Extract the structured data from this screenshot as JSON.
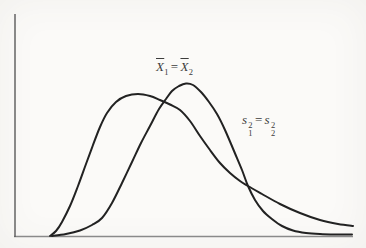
{
  "figure": {
    "background": "#fbfaf8",
    "axes": {
      "stroke_width": 1.4,
      "y_axis": {
        "x1": 15,
        "y1": 14,
        "x2": 15,
        "y2": 237,
        "color": "#5a5a5a"
      },
      "x_axis": {
        "x1": 14,
        "y1": 236.5,
        "x2": 353,
        "y2": 236.5,
        "color": "#8a8a8a"
      }
    },
    "curves": [
      {
        "name": "right-skewed-curve",
        "color": "#222222",
        "stroke_width": 2,
        "points": [
          [
            50,
            236
          ],
          [
            56,
            231
          ],
          [
            62,
            222
          ],
          [
            70,
            206
          ],
          [
            78,
            186
          ],
          [
            86,
            164
          ],
          [
            93,
            145
          ],
          [
            100,
            127
          ],
          [
            107,
            113
          ],
          [
            116,
            102
          ],
          [
            126,
            96
          ],
          [
            138,
            94
          ],
          [
            150,
            96
          ],
          [
            160,
            100
          ],
          [
            170,
            104.5
          ],
          [
            180,
            110
          ],
          [
            190,
            121
          ],
          [
            200,
            136
          ],
          [
            210,
            150
          ],
          [
            220,
            163
          ],
          [
            230,
            173
          ],
          [
            240,
            181
          ],
          [
            248,
            186
          ],
          [
            262,
            194
          ],
          [
            280,
            204
          ],
          [
            300,
            213
          ],
          [
            320,
            220
          ],
          [
            338,
            224
          ],
          [
            353,
            226
          ]
        ]
      },
      {
        "name": "left-skewed-curve",
        "color": "#222222",
        "stroke_width": 2,
        "points": [
          [
            52,
            236
          ],
          [
            66,
            234
          ],
          [
            80,
            230.5
          ],
          [
            92,
            225
          ],
          [
            102,
            218
          ],
          [
            112,
            203
          ],
          [
            122,
            183
          ],
          [
            132,
            162
          ],
          [
            141,
            143
          ],
          [
            150,
            126
          ],
          [
            159,
            109
          ],
          [
            166,
            99
          ],
          [
            172,
            91
          ],
          [
            179,
            86
          ],
          [
            186,
            83.5
          ],
          [
            193,
            85
          ],
          [
            201,
            92
          ],
          [
            209,
            102
          ],
          [
            217,
            114
          ],
          [
            225,
            130
          ],
          [
            234,
            151
          ],
          [
            242,
            170
          ],
          [
            248,
            186
          ],
          [
            255,
            200
          ],
          [
            263,
            211
          ],
          [
            272,
            219
          ],
          [
            282,
            226
          ],
          [
            293,
            230.5
          ],
          [
            306,
            233
          ],
          [
            320,
            234
          ],
          [
            336,
            234.5
          ],
          [
            352,
            234.5
          ]
        ]
      }
    ]
  },
  "annotations": {
    "means": {
      "lhs_base": "X",
      "lhs_sub": "1",
      "eq": "=",
      "rhs_base": "X",
      "rhs_sub": "2"
    },
    "variances": {
      "lhs_base": "s",
      "lhs_sup": "2",
      "lhs_sub": "1",
      "eq": "=",
      "rhs_base": "s",
      "rhs_sup": "2",
      "rhs_sub": "2"
    }
  }
}
